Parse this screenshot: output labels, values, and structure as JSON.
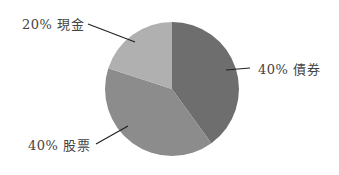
{
  "chart_data": {
    "type": "pie",
    "title": "",
    "categories": [
      "債券",
      "股票",
      "現金"
    ],
    "values": [
      40,
      40,
      20
    ],
    "labels": [
      "40% 債券",
      "40% 股票",
      "20% 現金"
    ],
    "colors": [
      "#6e6e6e",
      "#8c8c8c",
      "#b0b0b0"
    ],
    "start_angle": "12 o'clock, clockwise",
    "legend": "none (leader-line labels)"
  },
  "labels": {
    "bonds": "40% 債券",
    "stocks": "40% 股票",
    "cash": "20% 現金"
  }
}
